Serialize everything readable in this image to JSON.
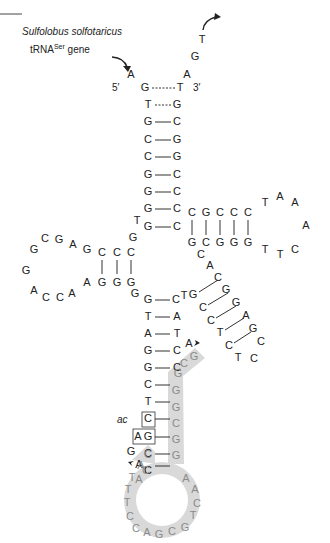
{
  "title": {
    "organism": "Sulfolobus solfotaricus",
    "gene_prefix": "tRNA",
    "gene_superscript": "Ser",
    "gene_suffix": " gene"
  },
  "ends": {
    "five_prime": "5′",
    "three_prime": "3′"
  },
  "annotation": {
    "ac": "ac"
  },
  "colors": {
    "highlight": "#d9d9d9",
    "text": "#222222",
    "highlight_text": "#8a8a8a"
  },
  "nucleotides": [
    {
      "id": "up5",
      "b": "A",
      "x": 131,
      "y": 75
    },
    {
      "id": "up3a",
      "b": "A",
      "x": 187,
      "y": 75
    },
    {
      "id": "up3g",
      "b": "G",
      "x": 195,
      "y": 57
    },
    {
      "id": "up3t",
      "b": "T",
      "x": 202,
      "y": 40
    },
    {
      "id": "acc_l1",
      "b": "G",
      "x": 145,
      "y": 88
    },
    {
      "id": "acc_r1",
      "b": "T",
      "x": 180,
      "y": 88
    },
    {
      "id": "acc_l2",
      "b": "T",
      "x": 148,
      "y": 105
    },
    {
      "id": "acc_r2",
      "b": "G",
      "x": 177,
      "y": 105
    },
    {
      "id": "acc_l3",
      "b": "G",
      "x": 148,
      "y": 122
    },
    {
      "id": "acc_r3",
      "b": "C",
      "x": 177,
      "y": 122
    },
    {
      "id": "acc_l4",
      "b": "C",
      "x": 148,
      "y": 140
    },
    {
      "id": "acc_r4",
      "b": "G",
      "x": 177,
      "y": 140
    },
    {
      "id": "acc_l5",
      "b": "C",
      "x": 148,
      "y": 157
    },
    {
      "id": "acc_r5",
      "b": "G",
      "x": 177,
      "y": 157
    },
    {
      "id": "acc_l6",
      "b": "G",
      "x": 148,
      "y": 175
    },
    {
      "id": "acc_r6",
      "b": "C",
      "x": 177,
      "y": 175
    },
    {
      "id": "acc_l7",
      "b": "G",
      "x": 148,
      "y": 192
    },
    {
      "id": "acc_r7",
      "b": "C",
      "x": 177,
      "y": 192
    },
    {
      "id": "acc_l8",
      "b": "G",
      "x": 148,
      "y": 209
    },
    {
      "id": "acc_r8",
      "b": "C",
      "x": 177,
      "y": 209
    },
    {
      "id": "acc_l9",
      "b": "G",
      "x": 148,
      "y": 227
    },
    {
      "id": "acc_r9",
      "b": "C",
      "x": 177,
      "y": 227
    },
    {
      "id": "j1",
      "b": "T",
      "x": 137,
      "y": 221
    },
    {
      "id": "j2",
      "b": "G",
      "x": 133,
      "y": 238
    },
    {
      "id": "d_t1",
      "b": "C",
      "x": 131,
      "y": 253
    },
    {
      "id": "d_t2",
      "b": "C",
      "x": 117,
      "y": 253
    },
    {
      "id": "d_t3",
      "b": "C",
      "x": 102,
      "y": 253
    },
    {
      "id": "d_t4",
      "b": "G",
      "x": 87,
      "y": 250
    },
    {
      "id": "d_t5",
      "b": "A",
      "x": 73,
      "y": 245
    },
    {
      "id": "d_t6",
      "b": "G",
      "x": 59,
      "y": 240
    },
    {
      "id": "d_t7",
      "b": "C",
      "x": 45,
      "y": 239
    },
    {
      "id": "d_t8",
      "b": "G",
      "x": 34,
      "y": 250
    },
    {
      "id": "d_t9",
      "b": "G",
      "x": 26,
      "y": 271
    },
    {
      "id": "d_b1",
      "b": "A",
      "x": 34,
      "y": 291
    },
    {
      "id": "d_b2",
      "b": "C",
      "x": 46,
      "y": 298
    },
    {
      "id": "d_b3",
      "b": "C",
      "x": 60,
      "y": 298
    },
    {
      "id": "d_b4",
      "b": "A",
      "x": 72,
      "y": 294
    },
    {
      "id": "d_b5",
      "b": "A",
      "x": 87,
      "y": 283
    },
    {
      "id": "d_b6",
      "b": "G",
      "x": 102,
      "y": 283
    },
    {
      "id": "d_b7",
      "b": "G",
      "x": 117,
      "y": 283
    },
    {
      "id": "d_b8",
      "b": "G",
      "x": 131,
      "y": 283
    },
    {
      "id": "d_b9",
      "b": "G",
      "x": 135,
      "y": 294
    },
    {
      "id": "ac_l1",
      "b": "G",
      "x": 148,
      "y": 300
    },
    {
      "id": "ac_r1",
      "b": "C",
      "x": 176,
      "y": 300
    },
    {
      "id": "ac_l2",
      "b": "T",
      "x": 148,
      "y": 317
    },
    {
      "id": "ac_r2",
      "b": "A",
      "x": 177,
      "y": 317
    },
    {
      "id": "ac_l3",
      "b": "A",
      "x": 148,
      "y": 334
    },
    {
      "id": "ac_r3",
      "b": "T",
      "x": 177,
      "y": 334
    },
    {
      "id": "ac_l4",
      "b": "G",
      "x": 148,
      "y": 351
    },
    {
      "id": "ac_r4",
      "b": "C",
      "x": 177,
      "y": 351
    },
    {
      "id": "ac_l5",
      "b": "G",
      "x": 148,
      "y": 368
    },
    {
      "id": "ac_r5",
      "b": "C",
      "x": 177,
      "y": 368
    },
    {
      "id": "ac_l6",
      "b": "C",
      "x": 148,
      "y": 385
    },
    {
      "id": "ac_l7",
      "b": "T",
      "x": 148,
      "y": 402
    },
    {
      "id": "ac_l8",
      "b": "C",
      "x": 148,
      "y": 419
    },
    {
      "id": "ac_l9a",
      "b": "A",
      "x": 138,
      "y": 437
    },
    {
      "id": "ac_l9",
      "b": "G",
      "x": 148,
      "y": 437
    },
    {
      "id": "ac_l10",
      "b": "C",
      "x": 148,
      "y": 454
    },
    {
      "id": "ac_l11",
      "b": "C",
      "x": 148,
      "y": 471
    },
    {
      "id": "ext_g",
      "b": "G",
      "x": 131,
      "y": 452
    },
    {
      "id": "ext_a",
      "b": "A",
      "x": 139,
      "y": 465
    },
    {
      "id": "tr_t1",
      "b": "C",
      "x": 192,
      "y": 213
    },
    {
      "id": "tr_t2",
      "b": "G",
      "x": 206,
      "y": 213
    },
    {
      "id": "tr_t3",
      "b": "C",
      "x": 220,
      "y": 213
    },
    {
      "id": "tr_t4",
      "b": "C",
      "x": 234,
      "y": 213
    },
    {
      "id": "tr_t5",
      "b": "C",
      "x": 248,
      "y": 213
    },
    {
      "id": "tr_l1",
      "b": "T",
      "x": 265,
      "y": 203
    },
    {
      "id": "tr_l2",
      "b": "A",
      "x": 280,
      "y": 197
    },
    {
      "id": "tr_l3",
      "b": "A",
      "x": 295,
      "y": 203
    },
    {
      "id": "tr_l4",
      "b": "A",
      "x": 306,
      "y": 226
    },
    {
      "id": "tr_l5",
      "b": "C",
      "x": 295,
      "y": 250
    },
    {
      "id": "tr_l6",
      "b": "T",
      "x": 280,
      "y": 255
    },
    {
      "id": "tr_l7",
      "b": "T",
      "x": 265,
      "y": 250
    },
    {
      "id": "tr_b1",
      "b": "G",
      "x": 192,
      "y": 243
    },
    {
      "id": "tr_b2",
      "b": "C",
      "x": 206,
      "y": 243
    },
    {
      "id": "tr_b3",
      "b": "G",
      "x": 220,
      "y": 243
    },
    {
      "id": "tr_b4",
      "b": "G",
      "x": 234,
      "y": 243
    },
    {
      "id": "tr_b5",
      "b": "G",
      "x": 248,
      "y": 243
    },
    {
      "id": "v1",
      "b": "C",
      "x": 201,
      "y": 255
    },
    {
      "id": "v2",
      "b": "A",
      "x": 210,
      "y": 266
    },
    {
      "id": "v3",
      "b": "C",
      "x": 218,
      "y": 278
    },
    {
      "id": "v4",
      "b": "G",
      "x": 193,
      "y": 295
    },
    {
      "id": "v5",
      "b": "C",
      "x": 203,
      "y": 308
    },
    {
      "id": "v6",
      "b": "C",
      "x": 211,
      "y": 321
    },
    {
      "id": "v7",
      "b": "T",
      "x": 220,
      "y": 333
    },
    {
      "id": "v8",
      "b": "C",
      "x": 229,
      "y": 346
    },
    {
      "id": "v9",
      "b": "T",
      "x": 238,
      "y": 358
    },
    {
      "id": "v10",
      "b": "G",
      "x": 226,
      "y": 290
    },
    {
      "id": "v11",
      "b": "G",
      "x": 236,
      "y": 303
    },
    {
      "id": "v12",
      "b": "A",
      "x": 246,
      "y": 316
    },
    {
      "id": "v13",
      "b": "G",
      "x": 253,
      "y": 329
    },
    {
      "id": "v14",
      "b": "C",
      "x": 261,
      "y": 342
    },
    {
      "id": "v15",
      "b": "C",
      "x": 254,
      "y": 359
    },
    {
      "id": "v16",
      "b": "T",
      "x": 184,
      "y": 296
    },
    {
      "id": "dn_a",
      "b": "A",
      "x": 189,
      "y": 344
    }
  ],
  "highlighted": [
    {
      "b": "G",
      "x": 194,
      "y": 357
    },
    {
      "b": "C",
      "x": 184,
      "y": 364
    },
    {
      "b": "G",
      "x": 178,
      "y": 374
    },
    {
      "b": "G",
      "x": 176,
      "y": 391
    },
    {
      "b": "G",
      "x": 176,
      "y": 408
    },
    {
      "b": "C",
      "x": 176,
      "y": 424
    },
    {
      "b": "G",
      "x": 176,
      "y": 440
    },
    {
      "b": "G",
      "x": 176,
      "y": 456
    },
    {
      "b": "A",
      "x": 186,
      "y": 479
    },
    {
      "b": "A",
      "x": 195,
      "y": 490
    },
    {
      "b": "C",
      "x": 197,
      "y": 504
    },
    {
      "b": "T",
      "x": 193,
      "y": 516
    },
    {
      "b": "G",
      "x": 185,
      "y": 528
    },
    {
      "b": "C",
      "x": 172,
      "y": 532
    },
    {
      "b": "G",
      "x": 159,
      "y": 535
    },
    {
      "b": "A",
      "x": 147,
      "y": 533
    },
    {
      "b": "C",
      "x": 136,
      "y": 529
    },
    {
      "b": "C",
      "x": 130,
      "y": 517
    },
    {
      "b": "T",
      "x": 127,
      "y": 503
    },
    {
      "b": "T",
      "x": 128,
      "y": 490
    },
    {
      "b": "T",
      "x": 132,
      "y": 478
    },
    {
      "b": "A",
      "x": 141,
      "y": 466
    },
    {
      "b": "C",
      "x": 148,
      "y": 455
    },
    {
      "b": "C",
      "x": 146,
      "y": 471
    },
    {
      "b": "A",
      "x": 139,
      "y": 480
    }
  ]
}
